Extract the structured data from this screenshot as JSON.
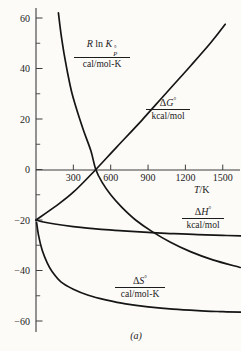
{
  "figure": {
    "caption": "(a)",
    "background": "#fcfbf8",
    "curve_color": "#151515",
    "axis_color": "#3d3d3d"
  },
  "labels": {
    "rln": {
      "r": "R",
      "ln": " ln ",
      "k": "K",
      "deg": "°",
      "p": "P",
      "den": "cal/mol-K"
    },
    "dg": {
      "d": "Δ",
      "v": "G",
      "deg": "°",
      "den": "kcal/mol"
    },
    "dh": {
      "d": "Δ",
      "v": "H",
      "deg": "°",
      "den": "kcal/mol"
    },
    "ds": {
      "d": "Δ",
      "v": "S",
      "deg": "°",
      "den": "cal/mol-K"
    },
    "xaxis": {
      "t": "T",
      "rest": "/K"
    }
  },
  "chart_data": {
    "type": "line",
    "title": "",
    "xlabel": "T/K",
    "ylabel": "",
    "x_range": [
      0,
      1680
    ],
    "y_range": [
      -64,
      64
    ],
    "x_ticks": [
      300,
      600,
      900,
      1200,
      1500
    ],
    "y_ticks": [
      60,
      40,
      20,
      0,
      -20,
      -40,
      -60
    ],
    "y_minor_ticks": [
      50,
      30,
      10,
      -10,
      -30,
      -50
    ],
    "grid": false,
    "legend": "inline-curve-labels",
    "series": [
      {
        "name": "R ln Kp° / cal/mol-K",
        "points": [
          [
            180,
            62
          ],
          [
            200,
            54
          ],
          [
            225,
            46
          ],
          [
            255,
            38
          ],
          [
            290,
            30
          ],
          [
            335,
            22.5
          ],
          [
            385,
            15
          ],
          [
            440,
            7.5
          ],
          [
            480,
            0
          ],
          [
            530,
            -5
          ],
          [
            600,
            -10
          ],
          [
            690,
            -15
          ],
          [
            800,
            -20
          ],
          [
            930,
            -24.5
          ],
          [
            1080,
            -28.8
          ],
          [
            1240,
            -32.5
          ],
          [
            1420,
            -35.8
          ],
          [
            1640,
            -38.8
          ]
        ]
      },
      {
        "name": "ΔG° / kcal/mol",
        "points": [
          [
            0,
            -20
          ],
          [
            150,
            -14.8
          ],
          [
            300,
            -9
          ],
          [
            480,
            0
          ],
          [
            650,
            9
          ],
          [
            850,
            19.5
          ],
          [
            1050,
            30.5
          ],
          [
            1250,
            41.5
          ],
          [
            1400,
            50
          ],
          [
            1520,
            57.5
          ]
        ]
      },
      {
        "name": "ΔH° / kcal/mol",
        "points": [
          [
            0,
            -20
          ],
          [
            60,
            -20.8
          ],
          [
            150,
            -21.6
          ],
          [
            300,
            -22.6
          ],
          [
            500,
            -23.6
          ],
          [
            700,
            -24.3
          ],
          [
            900,
            -24.9
          ],
          [
            1100,
            -25.4
          ],
          [
            1300,
            -25.8
          ],
          [
            1500,
            -26.1
          ],
          [
            1650,
            -26.3
          ]
        ]
      },
      {
        "name": "ΔS° / cal/mol-K",
        "points": [
          [
            5,
            -21
          ],
          [
            20,
            -26
          ],
          [
            50,
            -32
          ],
          [
            90,
            -37
          ],
          [
            130,
            -40.5
          ],
          [
            200,
            -44.5
          ],
          [
            300,
            -47.4
          ],
          [
            420,
            -49.8
          ],
          [
            560,
            -51.6
          ],
          [
            720,
            -53.2
          ],
          [
            900,
            -54.4
          ],
          [
            1100,
            -55.3
          ],
          [
            1300,
            -55.9
          ],
          [
            1500,
            -56.3
          ],
          [
            1650,
            -56.5
          ]
        ]
      }
    ]
  }
}
